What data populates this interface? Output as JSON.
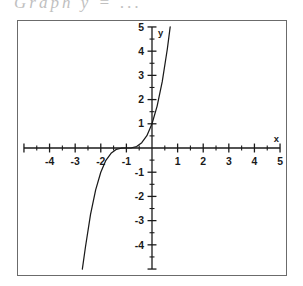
{
  "header": {
    "fragment_text": "Graph  y  =  ...",
    "note": "partially cropped handwritten/printed title above the plot frame"
  },
  "frame": {
    "border_color": "#6b6b6b",
    "background_color": "#ffffff"
  },
  "chart_data": {
    "type": "line",
    "title": "",
    "subtitle": "",
    "xlabel": "x",
    "ylabel": "y",
    "xlim": [
      -5,
      5
    ],
    "ylim": [
      -5,
      5
    ],
    "grid": false,
    "legend": null,
    "axis_color": "#1a1a1a",
    "curve_color": "#1a1a1a",
    "x_ticks_major": [
      -4,
      -3,
      -2,
      -1,
      1,
      2,
      3,
      4,
      5
    ],
    "x_tick_labels": [
      "-4",
      "-3",
      "-2",
      "-1",
      "1",
      "2",
      "3",
      "4",
      "5"
    ],
    "y_ticks_major": [
      5,
      4,
      3,
      2,
      1,
      -1,
      -2,
      -3,
      -4
    ],
    "y_tick_labels": [
      "5",
      "4",
      "3",
      "2",
      "1",
      "-1",
      "-2",
      "-3",
      "-4"
    ],
    "x_minor_step": 0.5,
    "y_minor_step": 0.5,
    "x_axis_label_pos": "right-end-above",
    "y_axis_label_pos": "top-end-right",
    "series": [
      {
        "name": "y = (x + 1)^3",
        "equation": "y=(x+1)^3",
        "x_root": -1,
        "inflection_point": [
          0,
          1
        ],
        "points": [
          [
            -2.72,
            -5.0
          ],
          [
            -2.6,
            -4.1
          ],
          [
            -2.4,
            -2.74
          ],
          [
            -2.2,
            -1.73
          ],
          [
            -2.0,
            -1.0
          ],
          [
            -1.8,
            -0.51
          ],
          [
            -1.6,
            -0.22
          ],
          [
            -1.4,
            -0.06
          ],
          [
            -1.2,
            -0.01
          ],
          [
            -1.0,
            0.0
          ],
          [
            -0.8,
            0.01
          ],
          [
            -0.6,
            0.06
          ],
          [
            -0.4,
            0.22
          ],
          [
            -0.2,
            0.51
          ],
          [
            0.0,
            1.0
          ],
          [
            0.2,
            1.73
          ],
          [
            0.4,
            2.74
          ],
          [
            0.6,
            4.1
          ],
          [
            0.71,
            5.0
          ]
        ]
      }
    ]
  }
}
